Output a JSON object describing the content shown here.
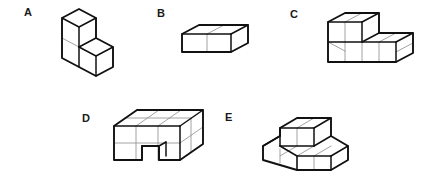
{
  "canvas": {
    "width": 424,
    "height": 182,
    "background_color": "#ffffff",
    "style": "isometric line drawing of unit-cube assemblies",
    "outline_color": "#111111",
    "seam_color": "#8a8a8a",
    "face_color": "#ffffff",
    "label_color": "#1a1a1a"
  },
  "figures": [
    {
      "id": "a",
      "label": "A",
      "description": "two-step staircase: tall back column one cube wide, single cube step in front",
      "cube_count": 3
    },
    {
      "id": "b",
      "label": "B",
      "description": "horizontal bar of two cubes, one unit tall and one unit deep",
      "cube_count": 2
    },
    {
      "id": "c",
      "label": "C",
      "description": "two-step staircase like A but the lower step is two cubes deep",
      "cube_count": 6
    },
    {
      "id": "d",
      "label": "D",
      "description": "large solid block, three wide by two deep by two tall, with a rectangular notch cut from the bottom front centre",
      "cube_count": 11
    },
    {
      "id": "e",
      "label": "E",
      "description": "flat two by two base slab with a raised row of two cubes along the back edge",
      "cube_count": 6
    }
  ]
}
